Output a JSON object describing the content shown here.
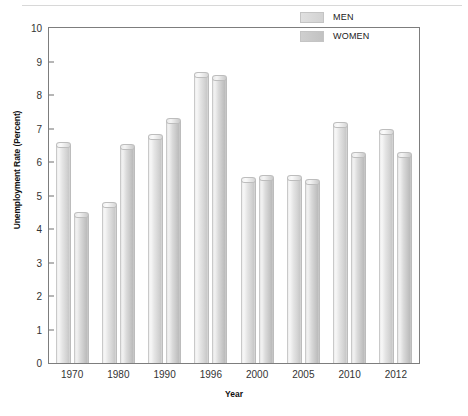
{
  "chart_data": {
    "type": "bar",
    "title": "",
    "subtitle": "",
    "xlabel": "Year",
    "ylabel": "Unemployment Rate (Percent)",
    "categories": [
      "1970",
      "1980",
      "1990",
      "1996",
      "2000",
      "2005",
      "2010",
      "2012"
    ],
    "series": [
      {
        "name": "MEN",
        "color": "#e0e0e0",
        "values": [
          6.6,
          4.8,
          6.85,
          8.7,
          5.55,
          5.6,
          7.2,
          7.0
        ]
      },
      {
        "name": "WOMEN",
        "color": "#c6c6c6",
        "values": [
          4.5,
          6.55,
          7.3,
          8.6,
          5.6,
          5.5,
          6.3,
          6.3
        ]
      }
    ],
    "ylim": [
      0,
      10
    ],
    "yticks": [
      0,
      1,
      2,
      3,
      4,
      5,
      6,
      7,
      8,
      9,
      10
    ],
    "ytick_labels": [
      "0",
      "1",
      "2",
      "3",
      "4",
      "5",
      "6",
      "7",
      "8",
      "9",
      "10"
    ],
    "grid": false,
    "legend_position": "top-right",
    "frame": true
  },
  "legend": {
    "entries": [
      {
        "label": "MEN",
        "swatch": "men-swatch"
      },
      {
        "label": "WOMEN",
        "swatch": "women-swatch"
      }
    ]
  },
  "axes": {
    "y_title": "Unemployment Rate (Percent)",
    "x_title": "Year"
  }
}
